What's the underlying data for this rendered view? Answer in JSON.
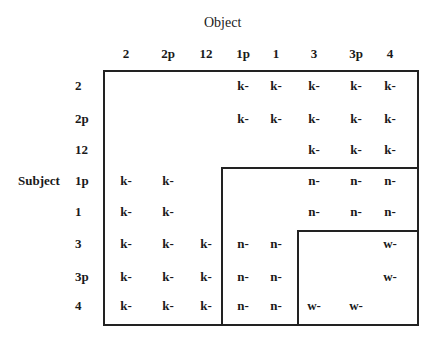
{
  "title": "Object",
  "row_axis_label": "Subject",
  "columns": [
    "2",
    "2p",
    "12",
    "1p",
    "1",
    "3",
    "3p",
    "4"
  ],
  "rows": [
    "2",
    "2p",
    "12",
    "1p",
    "1",
    "3",
    "3p",
    "4"
  ],
  "matrix": [
    [
      "",
      "",
      "",
      "k-",
      "k-",
      "k-",
      "k-",
      "k-"
    ],
    [
      "",
      "",
      "",
      "k-",
      "k-",
      "k-",
      "k-",
      "k-"
    ],
    [
      "",
      "",
      "",
      "",
      "",
      "k-",
      "k-",
      "k-"
    ],
    [
      "k-",
      "k-",
      "",
      "",
      "",
      "n-",
      "n-",
      "n-"
    ],
    [
      "k-",
      "k-",
      "",
      "",
      "",
      "n-",
      "n-",
      "n-"
    ],
    [
      "k-",
      "k-",
      "k-",
      "n-",
      "n-",
      "",
      "",
      "w-"
    ],
    [
      "k-",
      "k-",
      "k-",
      "n-",
      "n-",
      "",
      "",
      "w-"
    ],
    [
      "k-",
      "k-",
      "k-",
      "n-",
      "n-",
      "w-",
      "w-",
      ""
    ]
  ],
  "regions": [
    {
      "name": "outer",
      "from_row": "2",
      "from_col": "2"
    },
    {
      "name": "inner-1",
      "from_row": "1p",
      "from_col": "1p"
    },
    {
      "name": "inner-2",
      "from_row": "3",
      "from_col": "3"
    }
  ]
}
